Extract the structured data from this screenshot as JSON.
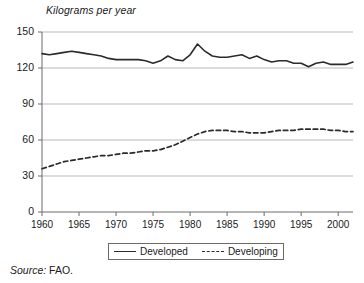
{
  "figure": {
    "axis_title": "Kilograms per year",
    "source_label": "Source:",
    "source_value": " FAO."
  },
  "legend": {
    "developed_label": "Developed",
    "developing_label": "Developing"
  },
  "chart_data": {
    "type": "line",
    "title": "Kilograms per year",
    "subtitle": "",
    "xlabel": "",
    "ylabel": "Kilograms per year",
    "source": "Source: FAO.",
    "xlim": [
      1960,
      2002
    ],
    "ylim": [
      0,
      150
    ],
    "yticks": [
      0,
      30,
      60,
      90,
      120,
      150
    ],
    "xticks": [
      1960,
      1965,
      1970,
      1975,
      1980,
      1985,
      1990,
      1995,
      2000
    ],
    "grid": "horizontal",
    "legend_position": "bottom-center",
    "x": [
      1960,
      1961,
      1962,
      1963,
      1964,
      1965,
      1966,
      1967,
      1968,
      1969,
      1970,
      1971,
      1972,
      1973,
      1974,
      1975,
      1976,
      1977,
      1978,
      1979,
      1980,
      1981,
      1982,
      1983,
      1984,
      1985,
      1986,
      1987,
      1988,
      1989,
      1990,
      1991,
      1992,
      1993,
      1994,
      1995,
      1996,
      1997,
      1998,
      1999,
      2000,
      2001,
      2002
    ],
    "series": [
      {
        "name": "Developed",
        "style": "solid",
        "color": "#2b2b2b",
        "values": [
          132,
          131,
          132,
          133,
          134,
          133,
          132,
          131,
          130,
          128,
          127,
          127,
          127,
          127,
          126,
          124,
          126,
          130,
          127,
          126,
          131,
          140,
          134,
          130,
          129,
          129,
          130,
          131,
          128,
          130,
          127,
          125,
          126,
          126,
          124,
          124,
          121,
          124,
          125,
          123,
          123,
          123,
          125
        ]
      },
      {
        "name": "Developing",
        "style": "dashed",
        "color": "#2b2b2b",
        "values": [
          36,
          38,
          40,
          42,
          43,
          44,
          45,
          46,
          47,
          47,
          48,
          49,
          49,
          50,
          51,
          51,
          52,
          54,
          56,
          59,
          62,
          65,
          67,
          68,
          68,
          68,
          67,
          67,
          66,
          66,
          66,
          67,
          68,
          68,
          68,
          69,
          69,
          69,
          69,
          68,
          68,
          67,
          67
        ]
      }
    ]
  },
  "yticks_text": [
    "150",
    "120",
    "90",
    "60",
    "30",
    "0"
  ],
  "xticks_text": [
    "1960",
    "1965",
    "1970",
    "1975",
    "1980",
    "1985",
    "1990",
    "1995",
    "2000"
  ]
}
